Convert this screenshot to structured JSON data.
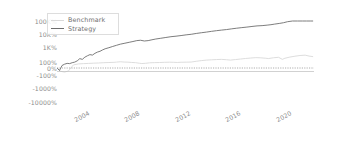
{
  "chart_data": {
    "type": "line",
    "title": "",
    "xlabel": "",
    "ylabel": "",
    "yscale": "symlog-percent",
    "grid": false,
    "legend_position": "upper-left",
    "y_ticks": [
      {
        "label": "100K%",
        "value": 100000
      },
      {
        "label": "10K%",
        "value": 10000
      },
      {
        "label": "1K%",
        "value": 1000
      },
      {
        "label": "100%",
        "value": 100
      },
      {
        "label": "0%",
        "value": 0
      },
      {
        "label": "-100%",
        "value": -100
      },
      {
        "label": "-1000%",
        "value": -1000
      },
      {
        "label": "-10000%",
        "value": -10000
      }
    ],
    "x_ticks": [
      {
        "label": "2004",
        "value": 2004
      },
      {
        "label": "2008",
        "value": 2008
      },
      {
        "label": "2012",
        "value": 2012
      },
      {
        "label": "2016",
        "value": 2016
      },
      {
        "label": "2020",
        "value": 2020
      }
    ],
    "xlim": [
      2002.3,
      2022.6
    ],
    "zero_line": {
      "value": 0,
      "style": "dotted",
      "color": "#9a9a9a"
    },
    "series": [
      {
        "name": "Benchmark",
        "color": "#d9d9d9",
        "points": [
          [
            2002.3,
            0
          ],
          [
            2002.6,
            -8
          ],
          [
            2002.9,
            -14
          ],
          [
            2003.2,
            -6
          ],
          [
            2003.6,
            10
          ],
          [
            2004.0,
            22
          ],
          [
            2004.4,
            28
          ],
          [
            2004.8,
            33
          ],
          [
            2005.2,
            40
          ],
          [
            2005.6,
            47
          ],
          [
            2006.0,
            58
          ],
          [
            2006.4,
            66
          ],
          [
            2006.8,
            78
          ],
          [
            2007.0,
            92
          ],
          [
            2007.3,
            104
          ],
          [
            2007.6,
            96
          ],
          [
            2007.9,
            88
          ],
          [
            2008.2,
            70
          ],
          [
            2008.5,
            60
          ],
          [
            2008.8,
            38
          ],
          [
            2009.0,
            30
          ],
          [
            2009.3,
            36
          ],
          [
            2009.6,
            52
          ],
          [
            2010.0,
            62
          ],
          [
            2010.4,
            66
          ],
          [
            2010.8,
            78
          ],
          [
            2011.2,
            86
          ],
          [
            2011.5,
            80
          ],
          [
            2011.8,
            70
          ],
          [
            2012.1,
            82
          ],
          [
            2012.5,
            88
          ],
          [
            2012.9,
            96
          ],
          [
            2013.3,
            112
          ],
          [
            2013.7,
            124
          ],
          [
            2014.1,
            134
          ],
          [
            2014.5,
            140
          ],
          [
            2014.9,
            146
          ],
          [
            2015.3,
            150
          ],
          [
            2015.7,
            142
          ],
          [
            2016.0,
            134
          ],
          [
            2016.4,
            146
          ],
          [
            2016.8,
            158
          ],
          [
            2017.2,
            172
          ],
          [
            2017.6,
            184
          ],
          [
            2018.0,
            196
          ],
          [
            2018.4,
            190
          ],
          [
            2018.8,
            178
          ],
          [
            2019.0,
            170
          ],
          [
            2019.4,
            192
          ],
          [
            2019.8,
            206
          ],
          [
            2020.1,
            150
          ],
          [
            2020.3,
            178
          ],
          [
            2020.7,
            214
          ],
          [
            2021.1,
            244
          ],
          [
            2021.5,
            272
          ],
          [
            2021.9,
            286
          ],
          [
            2022.2,
            250
          ],
          [
            2022.5,
            230
          ]
        ]
      },
      {
        "name": "Strategy",
        "color": "#6e6e6e",
        "points": [
          [
            2002.3,
            0
          ],
          [
            2002.5,
            -4
          ],
          [
            2002.7,
            6
          ],
          [
            2002.9,
            18
          ],
          [
            2003.1,
            34
          ],
          [
            2003.3,
            28
          ],
          [
            2003.5,
            58
          ],
          [
            2003.7,
            92
          ],
          [
            2003.9,
            120
          ],
          [
            2004.1,
            168
          ],
          [
            2004.3,
            150
          ],
          [
            2004.5,
            210
          ],
          [
            2004.7,
            260
          ],
          [
            2004.9,
            310
          ],
          [
            2005.1,
            290
          ],
          [
            2005.3,
            380
          ],
          [
            2005.5,
            460
          ],
          [
            2005.7,
            520
          ],
          [
            2005.9,
            640
          ],
          [
            2006.1,
            760
          ],
          [
            2006.4,
            900
          ],
          [
            2006.7,
            1100
          ],
          [
            2007.0,
            1350
          ],
          [
            2007.3,
            1650
          ],
          [
            2007.6,
            1900
          ],
          [
            2008.0,
            2300
          ],
          [
            2008.3,
            2650
          ],
          [
            2008.6,
            3100
          ],
          [
            2008.9,
            3300
          ],
          [
            2009.2,
            2900
          ],
          [
            2009.5,
            3100
          ],
          [
            2009.8,
            3600
          ],
          [
            2010.1,
            4100
          ],
          [
            2010.5,
            4700
          ],
          [
            2010.9,
            5400
          ],
          [
            2011.3,
            6200
          ],
          [
            2011.7,
            6800
          ],
          [
            2012.1,
            7600
          ],
          [
            2012.5,
            8600
          ],
          [
            2012.9,
            9500
          ],
          [
            2013.3,
            11000
          ],
          [
            2013.7,
            12500
          ],
          [
            2014.1,
            14000
          ],
          [
            2014.5,
            16000
          ],
          [
            2014.9,
            18000
          ],
          [
            2015.3,
            20000
          ],
          [
            2015.7,
            22000
          ],
          [
            2016.1,
            25000
          ],
          [
            2016.5,
            28000
          ],
          [
            2016.9,
            31000
          ],
          [
            2017.3,
            34000
          ],
          [
            2017.7,
            38000
          ],
          [
            2018.1,
            42000
          ],
          [
            2018.5,
            44000
          ],
          [
            2018.9,
            48000
          ],
          [
            2019.2,
            52000
          ],
          [
            2019.5,
            58000
          ],
          [
            2019.9,
            66000
          ],
          [
            2020.2,
            74000
          ],
          [
            2020.5,
            88000
          ],
          [
            2020.9,
            105000
          ],
          [
            2021.3,
            128000
          ],
          [
            2021.7,
            150000
          ],
          [
            2022.0,
            168000
          ],
          [
            2022.3,
            160000
          ],
          [
            2022.5,
            163000
          ]
        ]
      }
    ]
  },
  "legend": {
    "entries": [
      {
        "label": "Benchmark",
        "color": "#d9d9d9"
      },
      {
        "label": "Strategy",
        "color": "#6e6e6e"
      }
    ]
  }
}
